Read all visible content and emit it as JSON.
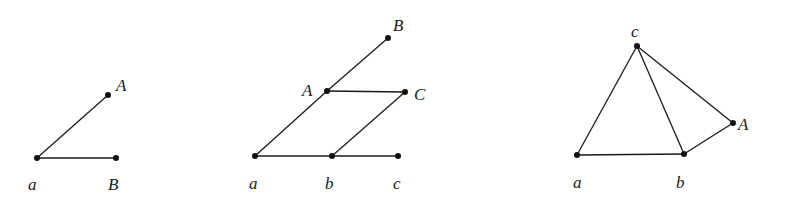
{
  "diagrams": [
    {
      "id": "graph-1",
      "nodes": [
        {
          "key": "a",
          "label": "a",
          "x": 37,
          "y": 158,
          "lx": 28,
          "ly": 190
        },
        {
          "key": "A",
          "label": "A",
          "x": 108,
          "y": 95,
          "lx": 116,
          "ly": 91
        },
        {
          "key": "B",
          "label": "B",
          "x": 116,
          "y": 158,
          "lx": 108,
          "ly": 190
        }
      ],
      "edges": [
        [
          "a",
          "A"
        ],
        [
          "a",
          "B"
        ]
      ]
    },
    {
      "id": "graph-2",
      "nodes": [
        {
          "key": "B",
          "label": "B",
          "x": 388,
          "y": 38,
          "lx": 393,
          "ly": 31
        },
        {
          "key": "A",
          "label": "A",
          "x": 327,
          "y": 91,
          "lx": 302,
          "ly": 96
        },
        {
          "key": "C",
          "label": "C",
          "x": 405,
          "y": 92,
          "lx": 414,
          "ly": 100
        },
        {
          "key": "a",
          "label": "a",
          "x": 255,
          "y": 156,
          "lx": 249,
          "ly": 189
        },
        {
          "key": "b",
          "label": "b",
          "x": 332,
          "y": 156,
          "lx": 325,
          "ly": 189
        },
        {
          "key": "c",
          "label": "c",
          "x": 398,
          "y": 156,
          "lx": 393,
          "ly": 189
        }
      ],
      "edges": [
        [
          "a",
          "A"
        ],
        [
          "A",
          "B"
        ],
        [
          "A",
          "C"
        ],
        [
          "a",
          "b"
        ],
        [
          "b",
          "c"
        ],
        [
          "b",
          "C"
        ]
      ]
    },
    {
      "id": "graph-3",
      "nodes": [
        {
          "key": "c",
          "label": "c",
          "x": 637,
          "y": 46,
          "lx": 631,
          "ly": 37
        },
        {
          "key": "A",
          "label": "A",
          "x": 733,
          "y": 123,
          "lx": 738,
          "ly": 130
        },
        {
          "key": "a",
          "label": "a",
          "x": 577,
          "y": 155,
          "lx": 573,
          "ly": 188
        },
        {
          "key": "b",
          "label": "b",
          "x": 684,
          "y": 154,
          "lx": 676,
          "ly": 188
        }
      ],
      "edges": [
        [
          "a",
          "c"
        ],
        [
          "a",
          "b"
        ],
        [
          "c",
          "b"
        ],
        [
          "c",
          "A"
        ],
        [
          "b",
          "A"
        ]
      ]
    }
  ]
}
